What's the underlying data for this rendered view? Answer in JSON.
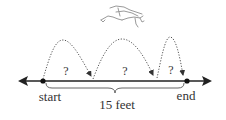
{
  "diagram": {
    "type": "number-line-jumps",
    "subject_icon": "frog-icon",
    "labels": {
      "start": "start",
      "end": "end",
      "total_distance": "15 feet"
    },
    "jumps": [
      {
        "label": "?"
      },
      {
        "label": "?"
      },
      {
        "label": "?"
      }
    ],
    "colors": {
      "line": "#222222",
      "jump_path": "#555555",
      "text": "#333333",
      "frog": "#888888"
    }
  }
}
